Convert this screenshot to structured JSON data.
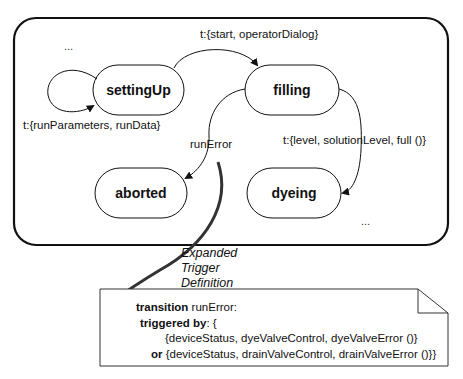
{
  "diagram": {
    "states": [
      {
        "id": "settingUp",
        "label": "settingUp"
      },
      {
        "id": "filling",
        "label": "filling"
      },
      {
        "id": "aborted",
        "label": "aborted"
      },
      {
        "id": "dyeing",
        "label": "dyeing"
      }
    ],
    "transitions": {
      "self_loop": "t:{runParameters, runData}",
      "setting_to_filling": "t:{start, operatorDialog}",
      "filling_to_dyeing": "t:{level, solutionLevel, full ()}",
      "filling_to_aborted": "runError"
    },
    "ellipsis_top": "...",
    "ellipsis_bottom": "...",
    "callout": {
      "line1": "Expanded",
      "line2": "Trigger",
      "line3": "Definition"
    },
    "note": {
      "line1_keyword": "transition",
      "line1_rest": " runError:",
      "line2_keyword": "triggered by",
      "line2_rest": ": {",
      "line3": "{deviceStatus, dyeValveControl, dyeValveError ()}",
      "line4_keyword": "or",
      "line4_rest": " {deviceStatus, drainValveControl, drainValveError ()}}"
    }
  }
}
